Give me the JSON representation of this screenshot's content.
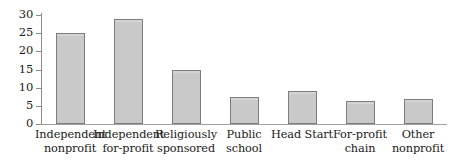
{
  "chart_data": {
    "type": "bar",
    "title": "",
    "subtitle": "",
    "xlabel": "",
    "ylabel": "",
    "ylim": [
      0,
      30
    ],
    "yticks": [
      0,
      5,
      10,
      15,
      20,
      25,
      30
    ],
    "ytick_labels": [
      "0",
      "5",
      "10",
      "15",
      "20",
      "25",
      "30"
    ],
    "grid": false,
    "legend": false,
    "legend_position": "none",
    "categories": [
      "Independent nonprofit",
      "Independent for-profit",
      "Religiously sponsored",
      "Public school",
      "Head Start",
      "For-profit chain",
      "Other nonprofit"
    ],
    "category_lines": [
      [
        "Independent",
        "nonprofit"
      ],
      [
        "Independent",
        "for-profit"
      ],
      [
        "Religiously",
        "sponsored"
      ],
      [
        "Public",
        "school"
      ],
      [
        "Head Start",
        ""
      ],
      [
        "For-profit",
        "chain"
      ],
      [
        "Other",
        "nonprofit"
      ]
    ],
    "values": [
      25,
      29,
      15,
      7.5,
      9,
      6.2,
      7
    ],
    "colors": {
      "bar_fill": "#c9c9c9",
      "bar_border": "#7d7d7d",
      "axis": "#8b8b8b",
      "text": "#1a1a1a",
      "background": "#ffffff"
    }
  }
}
